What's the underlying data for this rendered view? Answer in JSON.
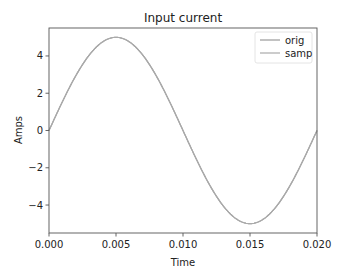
{
  "chart_data": {
    "type": "line",
    "title": "Input current",
    "xlabel": "Time",
    "ylabel": "Amps",
    "xlim": [
      0.0,
      0.02
    ],
    "ylim": [
      -5.5,
      5.5
    ],
    "xticks": [
      0.0,
      0.005,
      0.01,
      0.015,
      0.02
    ],
    "xtick_labels": [
      "0.000",
      "0.005",
      "0.010",
      "0.015",
      "0.020"
    ],
    "yticks": [
      4,
      2,
      0,
      -2,
      -4
    ],
    "ytick_labels": [
      "4",
      "2",
      "0",
      "−2",
      "−4"
    ],
    "grid": false,
    "legend_position": "upper right",
    "series": [
      {
        "name": "orig",
        "color": "#999999",
        "function": "5*sin(2*pi*50*t)",
        "amplitude": 5,
        "frequency_hz": 50,
        "x": [
          0.0,
          0.0025,
          0.005,
          0.0075,
          0.01,
          0.0125,
          0.015,
          0.0175,
          0.02
        ],
        "values": [
          0,
          3.54,
          5,
          3.54,
          0,
          -3.54,
          -5,
          -3.54,
          0
        ]
      },
      {
        "name": "samp",
        "color": "#aaaaaa",
        "function": "5*sin(2*pi*50*t)",
        "amplitude": 5,
        "frequency_hz": 50,
        "x": [
          0.0,
          0.0025,
          0.005,
          0.0075,
          0.01,
          0.0125,
          0.015,
          0.0175,
          0.02
        ],
        "values": [
          0,
          3.54,
          5,
          3.54,
          0,
          -3.54,
          -5,
          -3.54,
          0
        ]
      }
    ]
  }
}
